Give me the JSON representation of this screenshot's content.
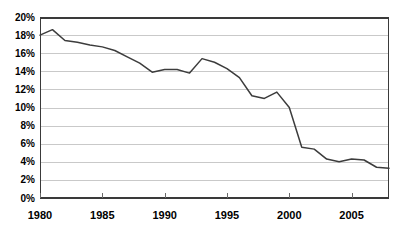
{
  "chart_data": {
    "type": "line",
    "title": "",
    "subtitle": "",
    "xlabel": "",
    "ylabel": "",
    "legend": [],
    "legend_position": "none",
    "grid": true,
    "grid_axis": "y",
    "xlim": [
      1980,
      2008
    ],
    "ylim": [
      0,
      20
    ],
    "y_tick_step": 2,
    "y_tick_values": [
      0,
      2,
      4,
      6,
      8,
      10,
      12,
      14,
      16,
      18,
      20
    ],
    "y_tick_labels": [
      "0%",
      "2%",
      "4%",
      "6%",
      "8%",
      "10%",
      "12%",
      "14%",
      "16%",
      "18%",
      "20%"
    ],
    "x_tick_values": [
      1980,
      1985,
      1990,
      1995,
      2000,
      2005
    ],
    "x_tick_labels": [
      "1980",
      "1985",
      "1990",
      "1995",
      "2000",
      "2005"
    ],
    "unit": "percent",
    "series": [
      {
        "name": "series-1",
        "color": "#3c3c3c",
        "x": [
          1980,
          1981,
          1982,
          1983,
          1984,
          1985,
          1986,
          1987,
          1988,
          1989,
          1990,
          1991,
          1992,
          1993,
          1994,
          1995,
          1996,
          1997,
          1998,
          1999,
          2000,
          2001,
          2002,
          2003,
          2004,
          2005,
          2006,
          2007,
          2008
        ],
        "values": [
          18.0,
          18.6,
          17.4,
          17.2,
          16.9,
          16.7,
          16.3,
          15.6,
          14.9,
          13.9,
          14.2,
          14.2,
          13.8,
          15.4,
          15.0,
          14.3,
          13.3,
          11.3,
          11.0,
          11.7,
          10.0,
          5.6,
          5.4,
          4.3,
          4.0,
          4.3,
          4.2,
          3.4,
          3.3
        ]
      }
    ]
  },
  "geometry": {
    "plot_left": 40,
    "plot_right": 389,
    "plot_top": 17,
    "plot_bottom": 198
  }
}
